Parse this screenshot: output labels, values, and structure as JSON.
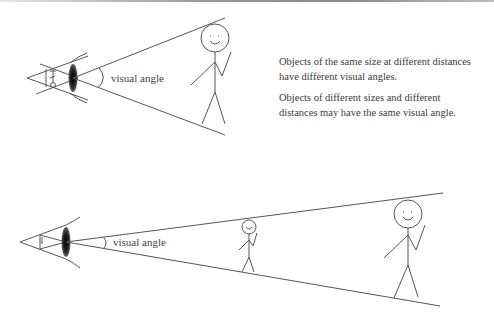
{
  "top_diagram": {
    "angle_label": "visual angle"
  },
  "bottom_diagram": {
    "angle_label": "visual angle"
  },
  "notes": [
    "Objects of the same size at different distances have different visual angles.",
    "Objects of different sizes and different distances may have the same visual angle."
  ],
  "colors": {
    "line": "#555555",
    "lens": "#1a1a1a",
    "text": "#3a3a3a"
  }
}
